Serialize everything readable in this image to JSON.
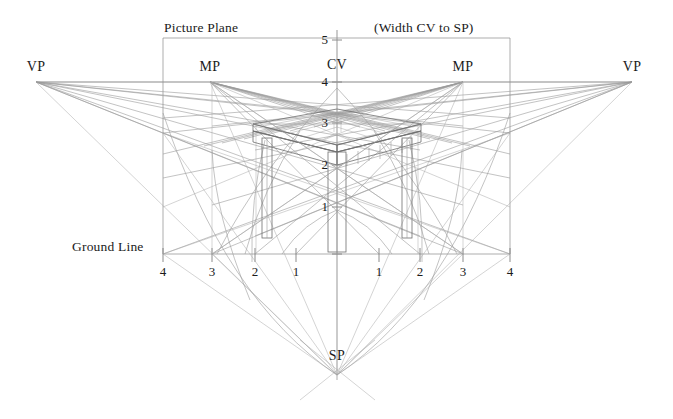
{
  "diagram": {
    "background_color": "#ffffff",
    "line_color": "#8e8e8e",
    "line_color_dark": "#6b6b6b",
    "text_color": "#1b1b1b",
    "captions": {
      "picture_plane": "Picture Plane",
      "width_cv_to_sp": "(Width CV to SP)",
      "ground_line": "Ground Line"
    },
    "points": [
      {
        "name": "vanishing-point-left",
        "label": "VP",
        "x": 36,
        "y": 82
      },
      {
        "name": "measuring-point-left",
        "label": "MP",
        "x": 210,
        "y": 82
      },
      {
        "name": "center-of-vision",
        "label": "CV",
        "x": 337,
        "y": 82
      },
      {
        "name": "measuring-point-right",
        "label": "MP",
        "x": 463,
        "y": 82
      },
      {
        "name": "vanishing-point-right",
        "label": "VP",
        "x": 632,
        "y": 82
      },
      {
        "name": "station-point",
        "label": "SP",
        "x": 337,
        "y": 375
      }
    ],
    "vertical_scale": {
      "axis_x": 337,
      "ticks": [
        {
          "label": "5",
          "value": 5,
          "y": 40
        },
        {
          "label": "4",
          "value": 4,
          "y": 82
        },
        {
          "label": "3",
          "value": 3,
          "y": 123
        },
        {
          "label": "2",
          "value": 2,
          "y": 165
        },
        {
          "label": "1",
          "value": 1,
          "y": 207
        }
      ]
    },
    "ground_line": {
      "y": 254,
      "x_start": 163,
      "x_end": 510,
      "ticks": [
        {
          "label": "4",
          "value": -4,
          "x": 163
        },
        {
          "label": "3",
          "value": -3,
          "x": 212
        },
        {
          "label": "2",
          "value": -2,
          "x": 255
        },
        {
          "label": "1",
          "value": -1,
          "x": 296
        },
        {
          "label": "1",
          "value": 1,
          "x": 379
        },
        {
          "label": "2",
          "value": 2,
          "x": 420
        },
        {
          "label": "3",
          "value": 3,
          "x": 463
        },
        {
          "label": "4",
          "value": 4,
          "x": 510
        }
      ]
    },
    "picture_plane_box": {
      "left": 163,
      "right": 510,
      "top": 38,
      "bottom": 254
    },
    "horizon_line": {
      "y": 82,
      "x_start": 36,
      "x_end": 632
    }
  }
}
